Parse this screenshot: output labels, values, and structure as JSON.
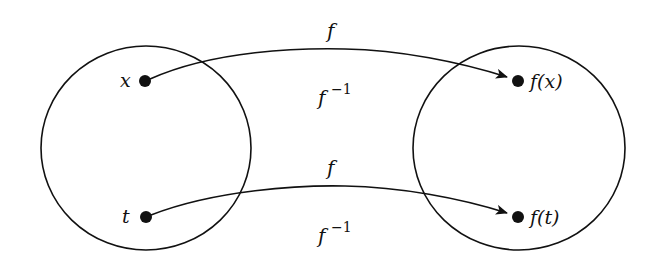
{
  "diagram": {
    "type": "function-mapping",
    "colors": {
      "stroke": "#111111",
      "background": "#ffffff"
    },
    "sets": [
      {
        "id": "domain",
        "cx": 146,
        "cy": 148,
        "rx": 105,
        "ry": 102
      },
      {
        "id": "codomain",
        "cx": 519,
        "cy": 148,
        "rx": 106,
        "ry": 102
      }
    ],
    "points": [
      {
        "id": "x",
        "label": "x",
        "cx": 145,
        "cy": 81,
        "label_x": 126,
        "label_y": 86
      },
      {
        "id": "t",
        "label": "t",
        "cx": 146,
        "cy": 217,
        "label_x": 126,
        "label_y": 222
      },
      {
        "id": "fx",
        "label": "f(x)",
        "cx": 518,
        "cy": 81,
        "label_x": 530,
        "label_y": 87
      },
      {
        "id": "ft",
        "label": "f(t)",
        "cx": 518,
        "cy": 217,
        "label_x": 530,
        "label_y": 223
      }
    ],
    "arrows": [
      {
        "id": "arrow-x-fx",
        "from": "x",
        "to": "fx",
        "label": "f",
        "inverse_label": "f",
        "inverse_exp": "−1"
      },
      {
        "id": "arrow-t-ft",
        "from": "t",
        "to": "ft",
        "label": "f",
        "inverse_label": "f",
        "inverse_exp": "−1"
      }
    ],
    "labels": {
      "top_f": "f",
      "top_finv": "f",
      "top_finv_exp": "−1",
      "bottom_f": "f",
      "bottom_finv": "f",
      "bottom_finv_exp": "−1",
      "x": "x",
      "t": "t",
      "fx": "f(x)",
      "ft": "f(t)"
    }
  }
}
